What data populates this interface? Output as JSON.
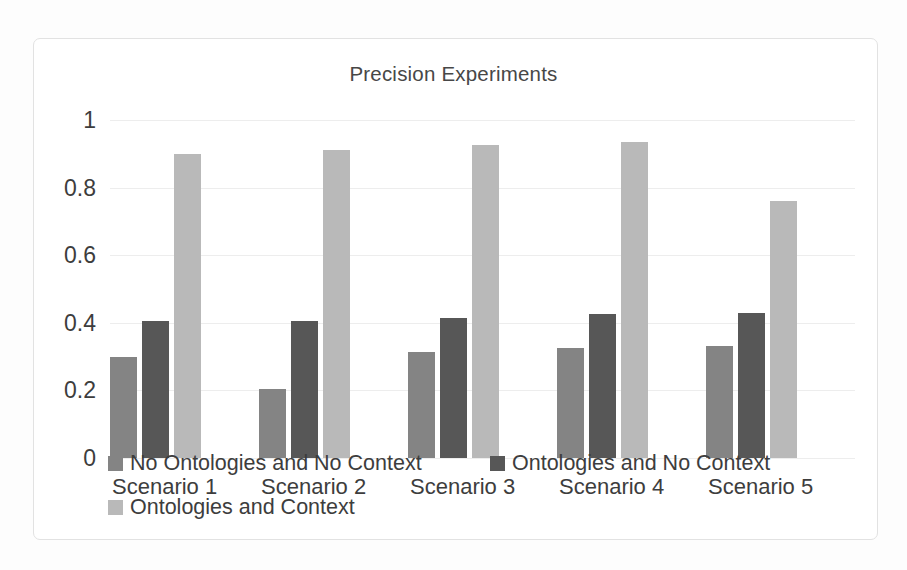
{
  "chart_data": {
    "type": "bar",
    "title": "Precision Experiments",
    "xlabel": "",
    "ylabel": "",
    "ylim": [
      0,
      1
    ],
    "yticks": [
      "1",
      "0.8",
      "0.6",
      "0.4",
      "0.2",
      "0"
    ],
    "ytick_values": [
      1,
      0.8,
      0.6,
      0.4,
      0.2,
      0
    ],
    "grid": true,
    "legend_position": "bottom",
    "categories": [
      "Scenario 1",
      "Scenario 2",
      "Scenario 3",
      "Scenario 4",
      "Scenario 5"
    ],
    "series": [
      {
        "name": "No Ontologies and No Context",
        "color": "#848484",
        "values": [
          0.3,
          0.205,
          0.315,
          0.325,
          0.33
        ]
      },
      {
        "name": "Ontologies and No Context",
        "color": "#575757",
        "values": [
          0.405,
          0.405,
          0.415,
          0.425,
          0.43
        ]
      },
      {
        "name": "Ontologies and Context",
        "color": "#b9b9b9",
        "values": [
          0.9,
          0.91,
          0.925,
          0.935,
          0.76
        ]
      }
    ]
  },
  "colors": {
    "series_1": "#848484",
    "series_2": "#575757",
    "series_3": "#b9b9b9",
    "gridline": "#ededed",
    "frame": "#e2e2e2",
    "text": "#3d3d3d",
    "background": "#ffffff"
  }
}
